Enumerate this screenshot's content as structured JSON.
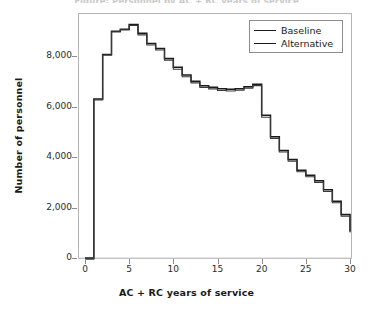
{
  "chart_data": {
    "type": "line",
    "subtype": "step",
    "title": "Figure: Personnel by AC + RC years of service",
    "xlabel": "AC + RC years of service",
    "ylabel": "Number of personnel",
    "xlim": [
      0,
      31
    ],
    "ylim": [
      0,
      9500
    ],
    "xticks": [
      0,
      5,
      10,
      15,
      20,
      25,
      30
    ],
    "xtick_labels": [
      "0",
      "5",
      "10",
      "15",
      "20",
      "25",
      "30"
    ],
    "yticks": [
      0,
      2000,
      4000,
      6000,
      8000
    ],
    "ytick_labels": [
      "0",
      "2,000",
      "4,000",
      "6,000",
      "8,000"
    ],
    "grid": false,
    "legend_position": "top-right",
    "x": [
      0,
      1,
      2,
      3,
      4,
      5,
      6,
      7,
      8,
      9,
      10,
      11,
      12,
      13,
      14,
      15,
      16,
      17,
      18,
      19,
      20,
      21,
      22,
      23,
      24,
      25,
      26,
      27,
      28,
      29,
      30
    ],
    "series": [
      {
        "name": "Baseline",
        "color": "#1a1a1a",
        "values": [
          0,
          6300,
          8060,
          8980,
          9060,
          9250,
          8900,
          8500,
          8300,
          7900,
          7550,
          7250,
          7000,
          6820,
          6760,
          6700,
          6680,
          6700,
          6780,
          6880,
          5650,
          4800,
          4260,
          3900,
          3480,
          3280,
          3060,
          2700,
          2250,
          1720,
          1050
        ]
      },
      {
        "name": "Alternative",
        "color": "#3a3a3a",
        "values": [
          0,
          6300,
          8080,
          9000,
          9080,
          9250,
          8880,
          8480,
          8280,
          7880,
          7520,
          7220,
          6980,
          6800,
          6740,
          6680,
          6660,
          6690,
          6770,
          6870,
          5620,
          4780,
          4240,
          3880,
          3460,
          3260,
          3040,
          2680,
          2230,
          1700,
          1050
        ]
      }
    ],
    "legend_entries": [
      "Baseline",
      "Alternative"
    ]
  },
  "axes": {
    "frame_color": "#b4b4b4",
    "tick_color": "#8c8c8c",
    "text_color": "#1a1a1a"
  }
}
